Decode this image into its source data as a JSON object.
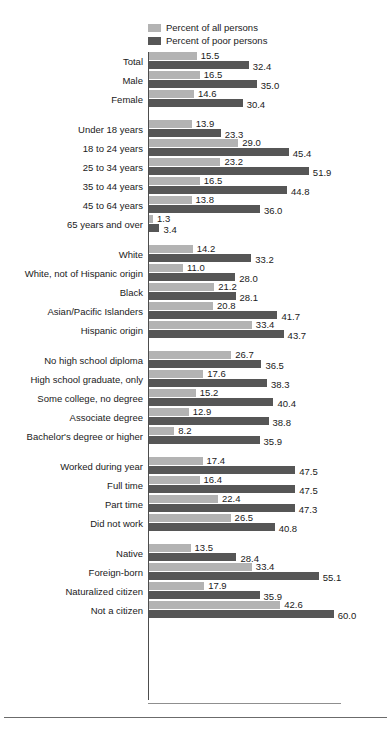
{
  "legend": {
    "position": "top-left-inside",
    "items": [
      {
        "label": "Percent of all persons",
        "color": "#b3b3b3",
        "key": "all"
      },
      {
        "label": "Percent of poor persons",
        "color": "#565656",
        "key": "poor"
      }
    ]
  },
  "colors": {
    "all_persons": "#b3b3b3",
    "poor_persons": "#565656",
    "axis": "#4d4d4d",
    "text": "#1a1a1a",
    "background": "#ffffff"
  },
  "chart_data": {
    "type": "bar",
    "orientation": "horizontal",
    "title": "",
    "subtitle": "",
    "xlabel": "",
    "ylabel": "",
    "xlim": [
      0,
      62
    ],
    "grid": false,
    "legend_position": "top-left",
    "series": [
      {
        "name": "Percent of all persons",
        "key": "all",
        "color": "#b3b3b3",
        "values": [
          15.5,
          16.5,
          14.6,
          13.9,
          29.0,
          23.2,
          16.5,
          13.8,
          1.3,
          14.2,
          11.0,
          21.2,
          20.8,
          33.4,
          26.7,
          17.6,
          15.2,
          12.9,
          8.2,
          17.4,
          16.4,
          22.4,
          26.5,
          13.5,
          33.4,
          17.9,
          42.6
        ]
      },
      {
        "name": "Percent of poor persons",
        "key": "poor",
        "color": "#565656",
        "values": [
          32.4,
          35.0,
          30.4,
          23.3,
          45.4,
          51.9,
          44.8,
          36.0,
          3.4,
          33.2,
          28.0,
          28.1,
          41.7,
          43.7,
          36.5,
          38.3,
          40.4,
          38.8,
          35.9,
          47.5,
          47.5,
          47.3,
          40.8,
          28.4,
          55.1,
          35.9,
          60.0
        ]
      }
    ],
    "categories": [
      "Total",
      "Male",
      "Female",
      "Under 18 years",
      "18 to 24 years",
      "25 to 34 years",
      "35 to 44 years",
      "45 to 64 years",
      "65 years and over",
      "White",
      "White, not of Hispanic origin",
      "Black",
      "Asian/Pacific Islanders",
      "Hispanic origin",
      "No high school diploma",
      "High school graduate, only",
      "Some college, no degree",
      "Associate degree",
      "Bachelor's degree or higher",
      "Worked during year",
      "Full time",
      "Part time",
      "Did not work",
      "Native",
      "Foreign-born",
      "Naturalized citizen",
      "Not a citizen"
    ],
    "groups": [
      {
        "name": "sex",
        "rows": [
          {
            "label": "Total",
            "all": "15.5",
            "poor": "32.4"
          },
          {
            "label": "Male",
            "all": "16.5",
            "poor": "35.0"
          },
          {
            "label": "Female",
            "all": "14.6",
            "poor": "30.4"
          }
        ]
      },
      {
        "name": "age",
        "rows": [
          {
            "label": "Under 18 years",
            "all": "13.9",
            "poor": "23.3"
          },
          {
            "label": "18 to 24 years",
            "all": "29.0",
            "poor": "45.4"
          },
          {
            "label": "25 to 34 years",
            "all": "23.2",
            "poor": "51.9"
          },
          {
            "label": "35 to 44 years",
            "all": "16.5",
            "poor": "44.8"
          },
          {
            "label": "45 to 64 years",
            "all": "13.8",
            "poor": "36.0"
          },
          {
            "label": "65 years and over",
            "all": "1.3",
            "poor": "3.4"
          }
        ]
      },
      {
        "name": "race-ethnicity",
        "rows": [
          {
            "label": "White",
            "all": "14.2",
            "poor": "33.2"
          },
          {
            "label": "White, not of Hispanic origin",
            "all": "11.0",
            "poor": "28.0"
          },
          {
            "label": "Black",
            "all": "21.2",
            "poor": "28.1"
          },
          {
            "label": "Asian/Pacific Islanders",
            "all": "20.8",
            "poor": "41.7"
          },
          {
            "label": "Hispanic origin",
            "all": "33.4",
            "poor": "43.7"
          }
        ]
      },
      {
        "name": "education",
        "rows": [
          {
            "label": "No high school diploma",
            "all": "26.7",
            "poor": "36.5"
          },
          {
            "label": "High school graduate, only",
            "all": "17.6",
            "poor": "38.3"
          },
          {
            "label": "Some college, no degree",
            "all": "15.2",
            "poor": "40.4"
          },
          {
            "label": "Associate degree",
            "all": "12.9",
            "poor": "38.8"
          },
          {
            "label": "Bachelor's degree or higher",
            "all": "8.2",
            "poor": "35.9"
          }
        ]
      },
      {
        "name": "work-experience",
        "rows": [
          {
            "label": "Worked during year",
            "all": "17.4",
            "poor": "47.5"
          },
          {
            "label": "Full time",
            "all": "16.4",
            "poor": "47.5"
          },
          {
            "label": "Part time",
            "all": "22.4",
            "poor": "47.3"
          },
          {
            "label": "Did not work",
            "all": "26.5",
            "poor": "40.8"
          }
        ]
      },
      {
        "name": "nativity",
        "rows": [
          {
            "label": "Native",
            "all": "13.5",
            "poor": "28.4"
          },
          {
            "label": "Foreign-born",
            "all": "33.4",
            "poor": "55.1"
          },
          {
            "label": "Naturalized citizen",
            "all": "17.9",
            "poor": "35.9"
          },
          {
            "label": "Not a citizen",
            "all": "42.6",
            "poor": "60.0"
          }
        ]
      }
    ]
  }
}
